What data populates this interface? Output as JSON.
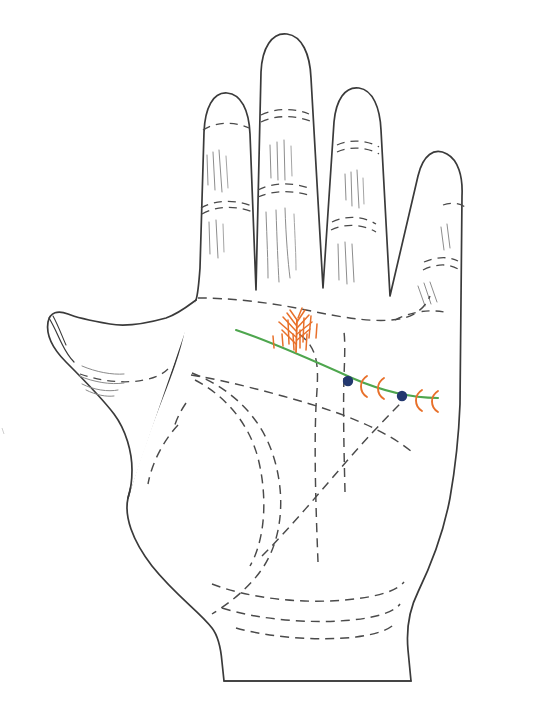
{
  "diagram": {
    "background_color": "#ffffff",
    "outline_color": "#3a3a3a",
    "crease_color": "#4a4a4a"
  },
  "palette": {
    "heart_line_green": "#4ea64e",
    "mark_orange": "#e8702a",
    "dot_blue": "#23386e",
    "outline": "#3a3a3a",
    "dashed_crease": "#4a4a4a",
    "fine_line": "#8d8d8d",
    "paper": "#ffffff"
  },
  "hand": {
    "name": "left-hand-palm",
    "view": "palmar surface",
    "outline_path": "M 205,297 L 203,140 Q 203,96 225,90 Q 247,84 250,124 L 258,294 M 258,294 L 258,84 Q 258,38 283,34 Q 305,30 307,72 L 310,296 M 310,296 L 333,118 Q 338,76 360,76 Q 382,78 378,118 L 365,300 M 365,300 L 415,176 Q 425,140 447,144 Q 468,150 458,188 L 424,312",
    "fingers": [
      {
        "name": "index-finger",
        "tip_y": 88,
        "creases": [
          "upper-phalange-crease",
          "lower-phalange-crease"
        ]
      },
      {
        "name": "middle-finger",
        "tip_y": 32,
        "creases": [
          "upper-phalange-crease",
          "lower-phalange-crease"
        ]
      },
      {
        "name": "ring-finger",
        "tip_y": 72,
        "creases": [
          "upper-phalange-crease",
          "lower-phalange-crease"
        ]
      },
      {
        "name": "little-finger",
        "tip_y": 146,
        "creases": [
          "upper-phalange-crease",
          "lower-phalange-crease"
        ]
      },
      {
        "name": "thumb",
        "tip_y": 310,
        "creases": [
          "thumb-interphalangeal-crease"
        ]
      }
    ]
  },
  "palm_lines": [
    {
      "name": "heart-line-dashed",
      "style": "dashed",
      "note": "upper transverse crease below fingers"
    },
    {
      "name": "head-line-dashed",
      "style": "dashed",
      "note": "middle transverse crease"
    },
    {
      "name": "life-line-dashed",
      "style": "dashed",
      "note": "arc around thumb ball"
    },
    {
      "name": "fate-line-dashed",
      "style": "dashed",
      "note": "vertical line rising toward middle finger"
    },
    {
      "name": "sun-line-dashed",
      "style": "dashed",
      "note": "vertical line toward ring finger"
    },
    {
      "name": "wrist-bracelet-1",
      "style": "dashed"
    },
    {
      "name": "wrist-bracelet-2",
      "style": "dashed"
    },
    {
      "name": "wrist-bracelet-3",
      "style": "dashed"
    }
  ],
  "highlight": {
    "name": "heart-line-highlight",
    "color": "#4ea64e",
    "stroke_width": 2.1,
    "path": "M 236,330 C 290,348 340,372 390,391 C 410,398 426,399 438,398"
  },
  "marks": [
    {
      "id": "tassel",
      "name": "tassel-branching-mark",
      "color": "#e8702a",
      "type": "tassel",
      "x": 293,
      "y": 330,
      "meaning": "frayed / tasselled line ending"
    },
    {
      "id": "dot-1",
      "name": "blue-dot-mark",
      "color": "#23386e",
      "type": "dot",
      "x": 348,
      "y": 382,
      "radius": 5
    },
    {
      "id": "arc-1",
      "name": "orange-crescent-mark",
      "color": "#e8702a",
      "type": "crescent",
      "x": 363,
      "y": 385
    },
    {
      "id": "arc-2",
      "name": "orange-crescent-mark",
      "color": "#e8702a",
      "type": "crescent",
      "x": 378,
      "y": 388
    },
    {
      "id": "dot-2",
      "name": "blue-dot-mark",
      "color": "#23386e",
      "type": "dot",
      "x": 402,
      "y": 396,
      "radius": 5
    },
    {
      "id": "arc-3",
      "name": "orange-crescent-mark",
      "color": "#e8702a",
      "type": "crescent",
      "x": 417,
      "y": 396
    },
    {
      "id": "arc-4",
      "name": "orange-crescent-mark",
      "color": "#e8702a",
      "type": "crescent",
      "x": 432,
      "y": 397
    }
  ],
  "counts": {
    "blue_dots": 2,
    "orange_crescents": 4,
    "tassels": 1,
    "wrist_bracelets": 3,
    "fingers": 5
  }
}
